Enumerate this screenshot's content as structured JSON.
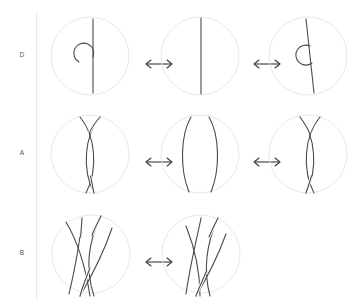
{
  "figure": {
    "background_color": "#ffffff",
    "divider_color": "#e6e6e6",
    "circle_color": "#e8e8e8",
    "strand_color": "#4a4a4a",
    "label_color": "#555555",
    "arrow_color": "#3a3a3a",
    "arrow_glyph": "double-headed-horizontal-arrow",
    "rows": [
      {
        "label": "D",
        "label_name": "row-label-d",
        "move": "Reidemeister I",
        "panels": [
          {
            "name": "panel-d-1",
            "kind": "loop-left-over"
          },
          {
            "name": "panel-d-2",
            "kind": "straight-strand"
          },
          {
            "name": "panel-d-3",
            "kind": "loop-left-under"
          }
        ],
        "arrows": [
          {
            "name": "arrow-d-1",
            "symbol": "↔"
          },
          {
            "name": "arrow-d-2",
            "symbol": "↔"
          }
        ]
      },
      {
        "label": "A",
        "label_name": "row-label-a",
        "move": "Reidemeister II",
        "panels": [
          {
            "name": "panel-a-1",
            "kind": "two-strand-double-crossing-a"
          },
          {
            "name": "panel-a-2",
            "kind": "two-strand-uncrossed"
          },
          {
            "name": "panel-a-3",
            "kind": "two-strand-double-crossing-b"
          }
        ],
        "arrows": [
          {
            "name": "arrow-a-1",
            "symbol": "↔"
          },
          {
            "name": "arrow-a-2",
            "symbol": "↔"
          }
        ]
      },
      {
        "label": "B",
        "label_name": "row-label-b",
        "move": "Reidemeister III",
        "panels": [
          {
            "name": "panel-b-1",
            "kind": "three-strand-triangle-left"
          },
          {
            "name": "panel-b-2",
            "kind": "three-strand-triangle-right"
          }
        ],
        "arrows": [
          {
            "name": "arrow-b-1",
            "symbol": "↔"
          }
        ]
      }
    ]
  }
}
